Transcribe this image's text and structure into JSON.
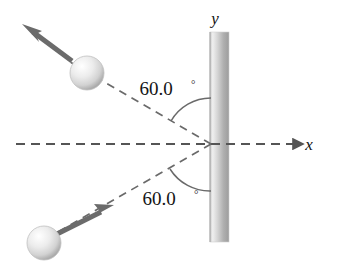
{
  "figure": {
    "background_color": "#ffffff",
    "width": 341,
    "height": 273
  },
  "axes": {
    "x_label": "x",
    "y_label": "y",
    "x_axis_style": "dashed",
    "x_axis_color": "#555555",
    "label_color": "#111111"
  },
  "wall": {
    "name": "vertical-wall",
    "orientation": "vertical",
    "x_left": 210,
    "x_right": 229,
    "y_top": 32,
    "y_bottom": 242,
    "fill_light": "#f0f0f0",
    "fill_dark": "#9a9a9a"
  },
  "annotations": {
    "angle_incoming": "60.0",
    "angle_outgoing": "60.0",
    "degree_symbol": "°"
  },
  "balls": [
    {
      "name": "ball-outgoing",
      "cx": 87,
      "cy": 73,
      "r": 17,
      "fill_light": "#fbfbfb",
      "fill_dark": "#b8b8b8"
    },
    {
      "name": "ball-incoming",
      "cx": 44,
      "cy": 243,
      "r": 17,
      "fill_light": "#fbfbfb",
      "fill_dark": "#b8b8b8"
    }
  ],
  "vectors": [
    {
      "name": "velocity-arrow-outgoing",
      "direction": "up-left",
      "color": "#6b6b6b",
      "x1": 70,
      "y1": 60,
      "x2": 26,
      "y2": 27
    },
    {
      "name": "velocity-arrow-incoming",
      "direction": "up-right",
      "color": "#6b6b6b",
      "x1": 58,
      "y1": 234,
      "x2": 110,
      "y2": 206
    }
  ],
  "rays": [
    {
      "name": "ray-outgoing-dashed",
      "color": "#6a6a6a",
      "x1": 211,
      "y1": 144,
      "x2": 70,
      "y2": 62
    },
    {
      "name": "ray-incoming-dashed",
      "color": "#6a6a6a",
      "x1": 211,
      "y1": 144,
      "x2": 61,
      "y2": 230
    }
  ],
  "impact_point": {
    "x": 211,
    "y": 144
  }
}
